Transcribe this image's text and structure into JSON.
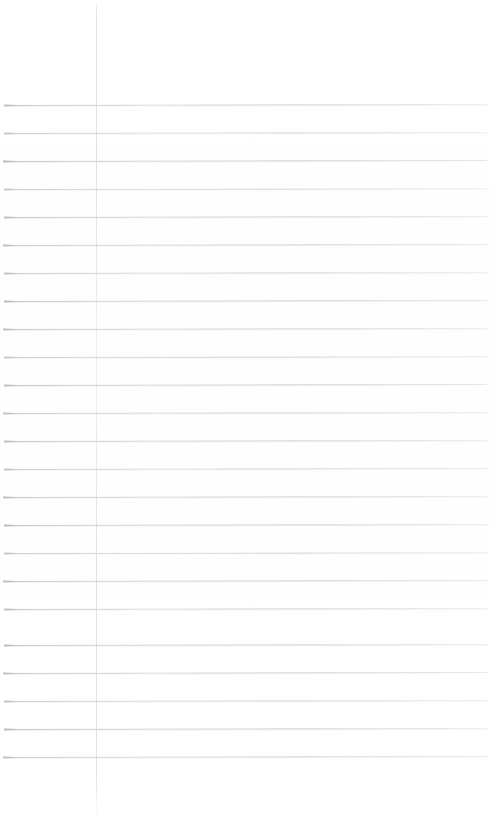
{
  "document": {
    "type": "scanned-lined-paper",
    "title": "Blank ruled notebook page",
    "content_text": "",
    "page_width": 494,
    "page_height": 815,
    "background_color": "#ffffff"
  },
  "margin_rule": {
    "name": "vertical-margin-line",
    "color": "#d4d4da",
    "x": 96,
    "top": 2,
    "height": 811,
    "thickness": 1
  },
  "ruled_lines": {
    "name": "horizontal-ruled-lines",
    "color": "#b9b9bd",
    "count": 24,
    "spacing": 28,
    "first_y": 105,
    "last_y": 757,
    "x_start": 4,
    "x_end": 487,
    "thickness": 1,
    "lines": [
      {
        "y": 105,
        "x": 4,
        "width": 483,
        "skew": -0.1,
        "opacity": 0.8
      },
      {
        "y": 133,
        "x": 4,
        "width": 483,
        "skew": -0.09,
        "opacity": 0.72
      },
      {
        "y": 161,
        "x": 3,
        "width": 484,
        "skew": -0.11,
        "opacity": 0.85
      },
      {
        "y": 189,
        "x": 4,
        "width": 483,
        "skew": -0.08,
        "opacity": 0.7
      },
      {
        "y": 217,
        "x": 4,
        "width": 483,
        "skew": -0.1,
        "opacity": 0.82
      },
      {
        "y": 245,
        "x": 3,
        "width": 484,
        "skew": -0.12,
        "opacity": 0.78
      },
      {
        "y": 273,
        "x": 4,
        "width": 483,
        "skew": -0.09,
        "opacity": 0.74
      },
      {
        "y": 301,
        "x": 4,
        "width": 483,
        "skew": -0.11,
        "opacity": 0.86
      },
      {
        "y": 329,
        "x": 3,
        "width": 484,
        "skew": -0.1,
        "opacity": 0.8
      },
      {
        "y": 357,
        "x": 4,
        "width": 483,
        "skew": -0.08,
        "opacity": 0.72
      },
      {
        "y": 385,
        "x": 4,
        "width": 483,
        "skew": -0.11,
        "opacity": 0.84
      },
      {
        "y": 413,
        "x": 3,
        "width": 484,
        "skew": -0.09,
        "opacity": 0.76
      },
      {
        "y": 441,
        "x": 4,
        "width": 483,
        "skew": -0.1,
        "opacity": 0.82
      },
      {
        "y": 469,
        "x": 4,
        "width": 483,
        "skew": -0.12,
        "opacity": 0.74
      },
      {
        "y": 497,
        "x": 3,
        "width": 484,
        "skew": -0.09,
        "opacity": 0.8
      },
      {
        "y": 525,
        "x": 4,
        "width": 483,
        "skew": -0.1,
        "opacity": 0.86
      },
      {
        "y": 553,
        "x": 4,
        "width": 483,
        "skew": -0.08,
        "opacity": 0.72
      },
      {
        "y": 581,
        "x": 3,
        "width": 484,
        "skew": -0.11,
        "opacity": 0.82
      },
      {
        "y": 609,
        "x": 4,
        "width": 483,
        "skew": -0.1,
        "opacity": 0.78
      },
      {
        "y": 645,
        "x": 4,
        "width": 483,
        "skew": -0.09,
        "opacity": 0.84
      },
      {
        "y": 673,
        "x": 3,
        "width": 484,
        "skew": -0.11,
        "opacity": 0.8
      },
      {
        "y": 701,
        "x": 4,
        "width": 483,
        "skew": -0.1,
        "opacity": 0.76
      },
      {
        "y": 729,
        "x": 4,
        "width": 483,
        "skew": -0.09,
        "opacity": 0.86
      },
      {
        "y": 757,
        "x": 3,
        "width": 484,
        "skew": -0.12,
        "opacity": 0.78
      }
    ]
  }
}
